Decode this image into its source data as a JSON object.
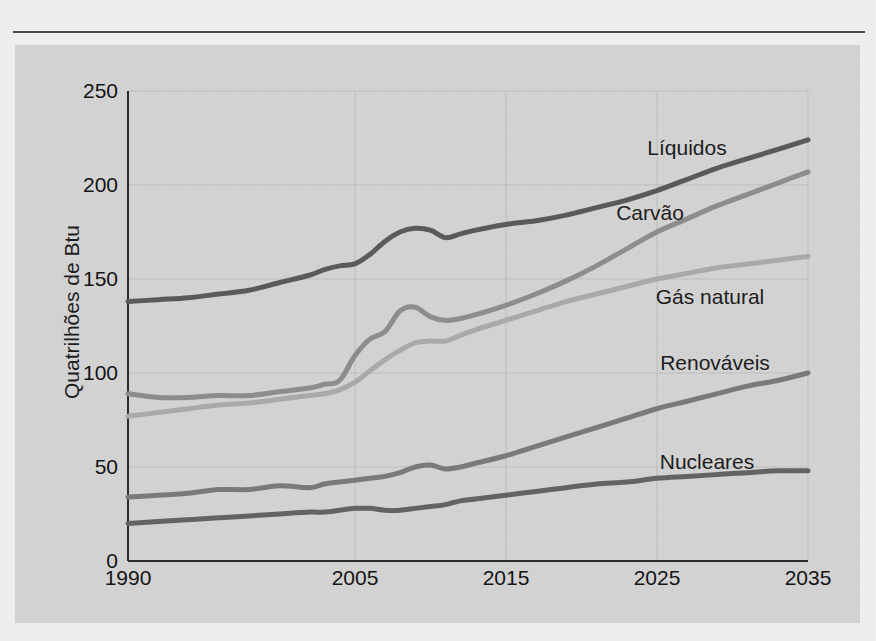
{
  "figure": {
    "panel_bg": "#d3d3d3",
    "page_bg": "#efefef",
    "rule_color": "#4a4a4a"
  },
  "axis": {
    "ylabel": "Quatrilhões de Btu",
    "y_ticks": [
      "0",
      "50",
      "100",
      "150",
      "200",
      "250"
    ],
    "x_ticks": [
      "1990",
      "2005",
      "2015",
      "2025",
      "2035"
    ]
  },
  "series_labels": {
    "liquidos": "Líquidos",
    "carvao": "Carvão",
    "gas": "Gás natural",
    "renovaveis": "Renováveis",
    "nucleares": "Nucleares"
  },
  "chart_data": {
    "type": "line",
    "title": "",
    "subtitle": "",
    "xlabel": "",
    "ylabel": "Quatrilhões de Btu",
    "xlim": [
      1990,
      2035
    ],
    "ylim": [
      0,
      250
    ],
    "x_tick_values": [
      1990,
      2005,
      2015,
      2025,
      2035
    ],
    "y_tick_values": [
      0,
      50,
      100,
      150,
      200,
      250
    ],
    "grid": true,
    "legend_position": "inline-right",
    "x": [
      1990,
      1992,
      1994,
      1996,
      1998,
      2000,
      2002,
      2003,
      2004,
      2005,
      2006,
      2007,
      2008,
      2009,
      2010,
      2011,
      2012,
      2013,
      2015,
      2017,
      2019,
      2021,
      2023,
      2025,
      2027,
      2029,
      2031,
      2033,
      2035
    ],
    "series": [
      {
        "name": "Líquidos",
        "color": "#5a5a5a",
        "label_x": 2027,
        "label_y": 224,
        "values": [
          138,
          139,
          140,
          142,
          144,
          148,
          152,
          155,
          157,
          158,
          163,
          170,
          175,
          177,
          176,
          172,
          174,
          176,
          179,
          181,
          184,
          188,
          192,
          197,
          203,
          209,
          214,
          219,
          224
        ]
      },
      {
        "name": "Carvão",
        "color": "#8d8d8d",
        "label_x": 2022,
        "label_y": 196,
        "values": [
          89,
          87,
          87,
          88,
          88,
          90,
          92,
          94,
          96,
          109,
          118,
          122,
          133,
          135,
          130,
          128,
          129,
          131,
          136,
          142,
          149,
          157,
          166,
          175,
          182,
          189,
          195,
          201,
          207
        ]
      },
      {
        "name": "Gás natural",
        "color": "#a9a9a9",
        "label_x": 2026,
        "label_y": 152,
        "values": [
          77,
          79,
          81,
          83,
          84,
          86,
          88,
          89,
          91,
          95,
          101,
          107,
          112,
          116,
          117,
          117,
          120,
          123,
          128,
          133,
          138,
          142,
          146,
          150,
          153,
          156,
          158,
          160,
          162
        ]
      },
      {
        "name": "Renováveis",
        "color": "#7a7a7a",
        "label_x": 2025,
        "label_y": 110,
        "values": [
          34,
          35,
          36,
          38,
          38,
          40,
          39,
          41,
          42,
          43,
          44,
          45,
          47,
          50,
          51,
          49,
          50,
          52,
          56,
          61,
          66,
          71,
          76,
          81,
          85,
          89,
          93,
          96,
          100
        ]
      },
      {
        "name": "Nucleares",
        "color": "#636363",
        "label_x": 2026,
        "label_y": 62,
        "values": [
          20,
          21,
          22,
          23,
          24,
          25,
          26,
          26,
          27,
          28,
          28,
          27,
          27,
          28,
          29,
          30,
          32,
          33,
          35,
          37,
          39,
          41,
          42,
          44,
          45,
          46,
          47,
          48,
          48
        ]
      }
    ]
  }
}
